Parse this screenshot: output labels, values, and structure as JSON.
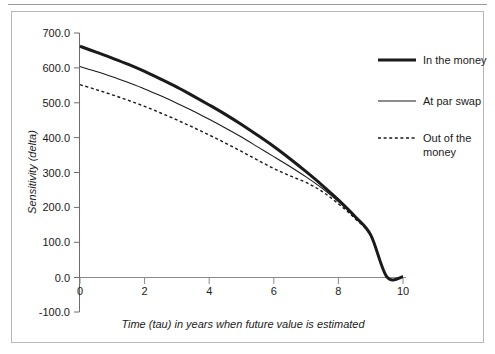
{
  "chart_data": {
    "type": "line",
    "title": "",
    "xlabel": "Time (tau) in years when future value is estimated",
    "ylabel": "Sensitivity (delta)",
    "xlim": [
      0,
      10
    ],
    "ylim": [
      -100.0,
      700.0
    ],
    "xticks": [
      0,
      2,
      4,
      6,
      8,
      10
    ],
    "xtick_labels": [
      "0",
      "2",
      "4",
      "6",
      "8",
      "10"
    ],
    "yticks": [
      -100.0,
      0.0,
      100.0,
      200.0,
      300.0,
      400.0,
      500.0,
      600.0,
      700.0
    ],
    "ytick_labels": [
      "-100.0",
      "0.0",
      "100.0",
      "200.0",
      "300.0",
      "400.0",
      "500.0",
      "600.0",
      "700.0"
    ],
    "grid": false,
    "legend_position": "right",
    "x": [
      0,
      0.5,
      1,
      1.5,
      2,
      2.5,
      3,
      3.5,
      4,
      4.5,
      5,
      5.5,
      6,
      6.5,
      7,
      7.5,
      8,
      8.5,
      9,
      9.5,
      10
    ],
    "series": [
      {
        "name": "In the money",
        "style": "solid-thick",
        "color": "#1a1a1a",
        "values": [
          662,
          645,
          628,
          610,
          590,
          568,
          545,
          520,
          494,
          467,
          438,
          407,
          375,
          340,
          303,
          264,
          222,
          176,
          122,
          2,
          2
        ]
      },
      {
        "name": "At par swap",
        "style": "solid-thin",
        "color": "#1a1a1a",
        "values": [
          604,
          590,
          575,
          558,
          540,
          520,
          499,
          477,
          453,
          428,
          402,
          374,
          346,
          318,
          288,
          255,
          217,
          173,
          120,
          2,
          2
        ]
      },
      {
        "name": "Out of the money",
        "style": "dotted",
        "color": "#1a1a1a",
        "values": [
          552,
          538,
          523,
          507,
          490,
          471,
          451,
          430,
          408,
          385,
          361,
          336,
          312,
          291,
          272,
          246,
          211,
          170,
          119,
          2,
          2
        ]
      }
    ]
  },
  "legend": {
    "entries": [
      {
        "label": "In the money"
      },
      {
        "label": "At par swap"
      },
      {
        "label_line1": "Out of the",
        "label_line2": "money"
      }
    ]
  }
}
